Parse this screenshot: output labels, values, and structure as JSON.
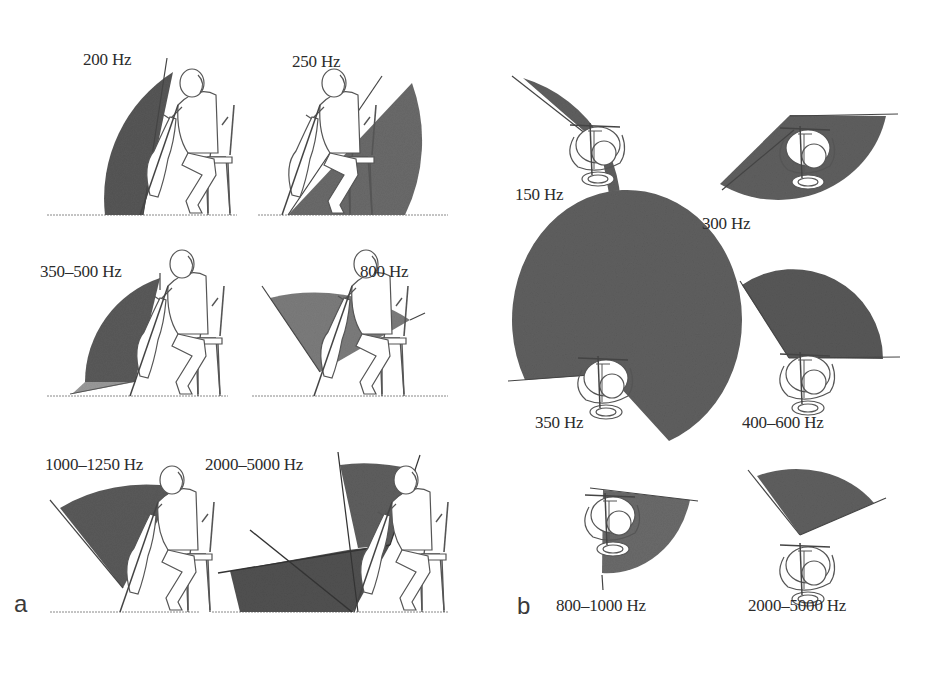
{
  "figure": {
    "panel_a": {
      "letter": "a",
      "view": "side view, seated cellist",
      "items": [
        {
          "label": "200 Hz"
        },
        {
          "label": "250 Hz"
        },
        {
          "label": "350–500 Hz"
        },
        {
          "label": "800 Hz"
        },
        {
          "label": "1000–1250 Hz"
        },
        {
          "label": "2000–5000 Hz"
        }
      ]
    },
    "panel_b": {
      "letter": "b",
      "view": "top view, cellist",
      "items": [
        {
          "label": "150 Hz"
        },
        {
          "label": "300 Hz"
        },
        {
          "label": "350 Hz"
        },
        {
          "label": "400–600 Hz"
        },
        {
          "label": "800–1000 Hz"
        },
        {
          "label": "2000–5000 Hz"
        }
      ]
    },
    "colors": {
      "sector_dark": "#5e5e5e",
      "sector_mid": "#7a7a7a",
      "line": "#3a3a3a",
      "background": "#ffffff"
    }
  }
}
